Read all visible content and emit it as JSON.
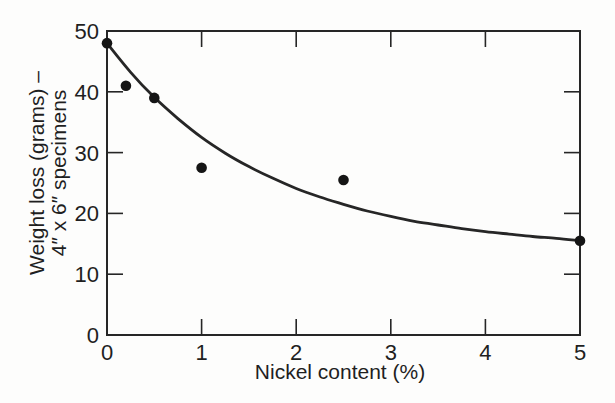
{
  "figure": {
    "background": "#fdfdfc",
    "ink_color": "#262626",
    "dot_color": "#151515"
  },
  "chart_data": {
    "type": "scatter",
    "title": "",
    "xlabel": "Nickel content (%)",
    "ylabel_lines": [
      "Weight loss (grams) –",
      "4″ x 6″ specimens"
    ],
    "xlim": [
      0,
      5
    ],
    "ylim": [
      0,
      50
    ],
    "xticks": [
      0,
      1,
      2,
      3,
      4,
      5
    ],
    "yticks": [
      0,
      10,
      20,
      30,
      40,
      50
    ],
    "grid": false,
    "legend": null,
    "points": [
      {
        "x": 0.0,
        "y": 48.0
      },
      {
        "x": 0.2,
        "y": 41.0
      },
      {
        "x": 0.5,
        "y": 39.0
      },
      {
        "x": 1.0,
        "y": 27.5
      },
      {
        "x": 2.5,
        "y": 25.5
      },
      {
        "x": 5.0,
        "y": 15.5
      }
    ],
    "curve": {
      "name": "fitted-curve",
      "points": [
        [
          0.0,
          48.0
        ],
        [
          0.25,
          43.2
        ],
        [
          0.5,
          39.1
        ],
        [
          0.75,
          35.6
        ],
        [
          1.0,
          32.5
        ],
        [
          1.25,
          29.9
        ],
        [
          1.5,
          27.7
        ],
        [
          1.75,
          25.8
        ],
        [
          2.0,
          24.1
        ],
        [
          2.25,
          22.7
        ],
        [
          2.5,
          21.5
        ],
        [
          2.75,
          20.4
        ],
        [
          3.0,
          19.5
        ],
        [
          3.25,
          18.7
        ],
        [
          3.5,
          18.1
        ],
        [
          3.75,
          17.5
        ],
        [
          4.0,
          17.0
        ],
        [
          4.25,
          16.6
        ],
        [
          4.5,
          16.2
        ],
        [
          4.75,
          15.9
        ],
        [
          5.0,
          15.5
        ]
      ]
    }
  }
}
